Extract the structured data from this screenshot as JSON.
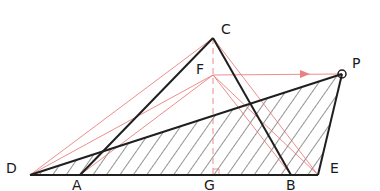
{
  "diagram": {
    "colors": {
      "main_line": "#1f1f1f",
      "construction_line": "#e86b6b",
      "hatch": "#2a2a2a",
      "background": "#ffffff"
    },
    "points": {
      "C": {
        "label": "C",
        "x": 213,
        "y": 38
      },
      "F": {
        "label": "F",
        "x": 213,
        "y": 75
      },
      "P": {
        "label": "P",
        "x": 342,
        "y": 74
      },
      "D": {
        "label": "D",
        "x": 30,
        "y": 175
      },
      "A": {
        "label": "A",
        "x": 80,
        "y": 175
      },
      "G": {
        "label": "G",
        "x": 213,
        "y": 175
      },
      "B": {
        "label": "B",
        "x": 291,
        "y": 175
      },
      "E": {
        "label": "E",
        "x": 318,
        "y": 175
      }
    },
    "labels": {
      "C": "C",
      "F": "F",
      "P": "P",
      "D": "D",
      "A": "A",
      "G": "G",
      "B": "B",
      "E": "E"
    }
  }
}
